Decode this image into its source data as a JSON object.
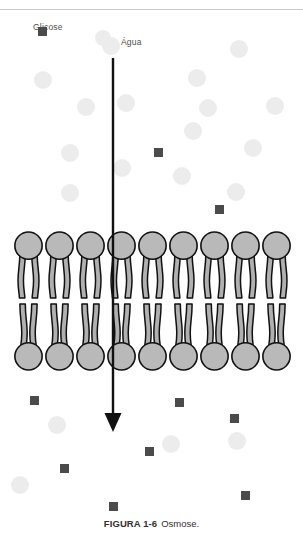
{
  "figure": {
    "caption_number": "FIGURA 1-6",
    "caption_text": "Osmose.",
    "top_rule": true
  },
  "legend": {
    "glucose_label": "Glicose",
    "glucose_marker": "dark-square",
    "glucose_marker_color": "#4b4b4b",
    "glucose_swatch": {
      "x": 42,
      "y": 31,
      "size": 9
    },
    "water_label": "Água",
    "water_marker": "light-circle",
    "water_marker_color": "#ececec",
    "water_swatch": {
      "x": 103,
      "y": 38,
      "size": 16
    }
  },
  "arrow": {
    "name": "osmosis-flow-arrow",
    "direction": "down",
    "color": "#111111",
    "x": 113,
    "y_start": 58,
    "y_end": 432,
    "shaft_width": 2.4,
    "head_width": 17,
    "head_height": 19
  },
  "membrane": {
    "name": "phospholipid-bilayer",
    "head_fill": "#b9b9b9",
    "tail_fill": "#b0b0b0",
    "stroke": "#111111",
    "left": 13,
    "right": 292,
    "top": 231,
    "bottom": 371,
    "units": 9
  },
  "particles": {
    "water_color": "#ececec",
    "glucose_color": "#4b4b4b",
    "water_radius": 9,
    "glucose_size": 9,
    "above_membrane": {
      "water": [
        {
          "x": 111,
          "y": 46
        },
        {
          "x": 43,
          "y": 80
        },
        {
          "x": 239,
          "y": 49
        },
        {
          "x": 197,
          "y": 78
        },
        {
          "x": 86,
          "y": 107
        },
        {
          "x": 275,
          "y": 106
        },
        {
          "x": 70,
          "y": 153
        },
        {
          "x": 208,
          "y": 108
        },
        {
          "x": 126,
          "y": 103
        },
        {
          "x": 193,
          "y": 131
        },
        {
          "x": 70,
          "y": 193
        },
        {
          "x": 122,
          "y": 168
        },
        {
          "x": 182,
          "y": 176
        },
        {
          "x": 253,
          "y": 148
        },
        {
          "x": 236,
          "y": 192
        }
      ],
      "glucose": [
        {
          "x": 42,
          "y": 31
        },
        {
          "x": 158,
          "y": 152
        },
        {
          "x": 219,
          "y": 209
        }
      ]
    },
    "below_membrane": {
      "water": [
        {
          "x": 57,
          "y": 425
        },
        {
          "x": 171,
          "y": 444
        },
        {
          "x": 237,
          "y": 441
        },
        {
          "x": 20,
          "y": 485
        }
      ],
      "glucose": [
        {
          "x": 34,
          "y": 400
        },
        {
          "x": 179,
          "y": 402
        },
        {
          "x": 234,
          "y": 418
        },
        {
          "x": 149,
          "y": 451
        },
        {
          "x": 64,
          "y": 468
        },
        {
          "x": 245,
          "y": 495
        },
        {
          "x": 113,
          "y": 506
        }
      ]
    }
  }
}
